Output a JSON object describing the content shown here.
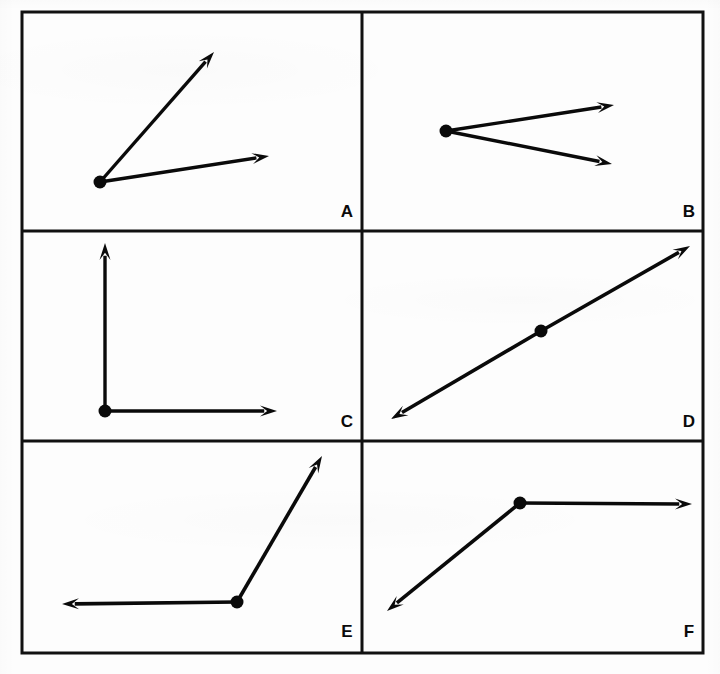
{
  "sheet": {
    "title": "Angle types worksheet figure",
    "background_color": "#fdfdfd",
    "ink_color": "#0a0a0a",
    "frame": {
      "x": 22,
      "y": 12,
      "width": 681,
      "height": 641,
      "border_width": 3
    },
    "grid": {
      "columns": 2,
      "rows": 3,
      "v_divider_x": 362,
      "h_divider_y": [
        231,
        441
      ],
      "divider_width": 3
    }
  },
  "panels": [
    {
      "id": "A",
      "label": "A",
      "label_pos": {
        "x": 347,
        "y": 213
      },
      "bounds": {
        "x": 22,
        "y": 12,
        "width": 340,
        "height": 219
      },
      "description": "acute angle, two rays from a common vertex",
      "vertex": {
        "x": 100,
        "y": 182
      },
      "stroke_width": 3.4,
      "rays": [
        {
          "name": "ray-up-right",
          "tip": {
            "x": 214,
            "y": 52
          },
          "arrow": "tip"
        },
        {
          "name": "ray-right",
          "tip": {
            "x": 269,
            "y": 156
          },
          "arrow": "tip"
        }
      ]
    },
    {
      "id": "B",
      "label": "B",
      "label_pos": {
        "x": 689,
        "y": 213
      },
      "bounds": {
        "x": 362,
        "y": 12,
        "width": 341,
        "height": 219
      },
      "description": "narrow acute angle opening to the right",
      "vertex": {
        "x": 446,
        "y": 131
      },
      "stroke_width": 3.4,
      "rays": [
        {
          "name": "ray-upper-right",
          "tip": {
            "x": 614,
            "y": 105
          },
          "arrow": "tip"
        },
        {
          "name": "ray-lower-right",
          "tip": {
            "x": 612,
            "y": 164
          },
          "arrow": "tip"
        }
      ]
    },
    {
      "id": "C",
      "label": "C",
      "label_pos": {
        "x": 347,
        "y": 423
      },
      "bounds": {
        "x": 22,
        "y": 231,
        "width": 340,
        "height": 210
      },
      "description": "right angle, vertical ray up and horizontal ray right",
      "vertex": {
        "x": 105,
        "y": 411
      },
      "stroke_width": 3.4,
      "rays": [
        {
          "name": "ray-up",
          "tip": {
            "x": 105,
            "y": 243
          },
          "arrow": "tip"
        },
        {
          "name": "ray-right",
          "tip": {
            "x": 277,
            "y": 411
          },
          "arrow": "tip"
        }
      ]
    },
    {
      "id": "D",
      "label": "D",
      "label_pos": {
        "x": 689,
        "y": 423
      },
      "bounds": {
        "x": 362,
        "y": 231,
        "width": 341,
        "height": 210
      },
      "description": "straight angle, double-headed line through a point",
      "vertex": {
        "x": 541,
        "y": 331
      },
      "stroke_width": 3.6,
      "rays": [
        {
          "name": "ray-lower-left",
          "tip": {
            "x": 391,
            "y": 419
          },
          "arrow": "tip"
        },
        {
          "name": "ray-upper-right",
          "tip": {
            "x": 690,
            "y": 246
          },
          "arrow": "tip"
        }
      ]
    },
    {
      "id": "E",
      "label": "E",
      "label_pos": {
        "x": 347,
        "y": 633
      },
      "bounds": {
        "x": 22,
        "y": 441,
        "width": 340,
        "height": 212
      },
      "description": "obtuse angle, ray left and ray up-right",
      "vertex": {
        "x": 237,
        "y": 602
      },
      "stroke_width": 3.6,
      "rays": [
        {
          "name": "ray-left",
          "tip": {
            "x": 62,
            "y": 604
          },
          "arrow": "tip"
        },
        {
          "name": "ray-up-right",
          "tip": {
            "x": 322,
            "y": 456
          },
          "arrow": "tip"
        }
      ]
    },
    {
      "id": "F",
      "label": "F",
      "label_pos": {
        "x": 689,
        "y": 633
      },
      "bounds": {
        "x": 362,
        "y": 441,
        "width": 341,
        "height": 212
      },
      "description": "obtuse angle, ray right and ray down-left",
      "vertex": {
        "x": 520,
        "y": 503
      },
      "stroke_width": 3.6,
      "rays": [
        {
          "name": "ray-right",
          "tip": {
            "x": 692,
            "y": 504
          },
          "arrow": "tip"
        },
        {
          "name": "ray-down-left",
          "tip": {
            "x": 387,
            "y": 611
          },
          "arrow": "tip"
        }
      ]
    }
  ],
  "marker": {
    "dot_radius": 6.5,
    "arrow_length": 17,
    "arrow_half_width": 5.5
  }
}
